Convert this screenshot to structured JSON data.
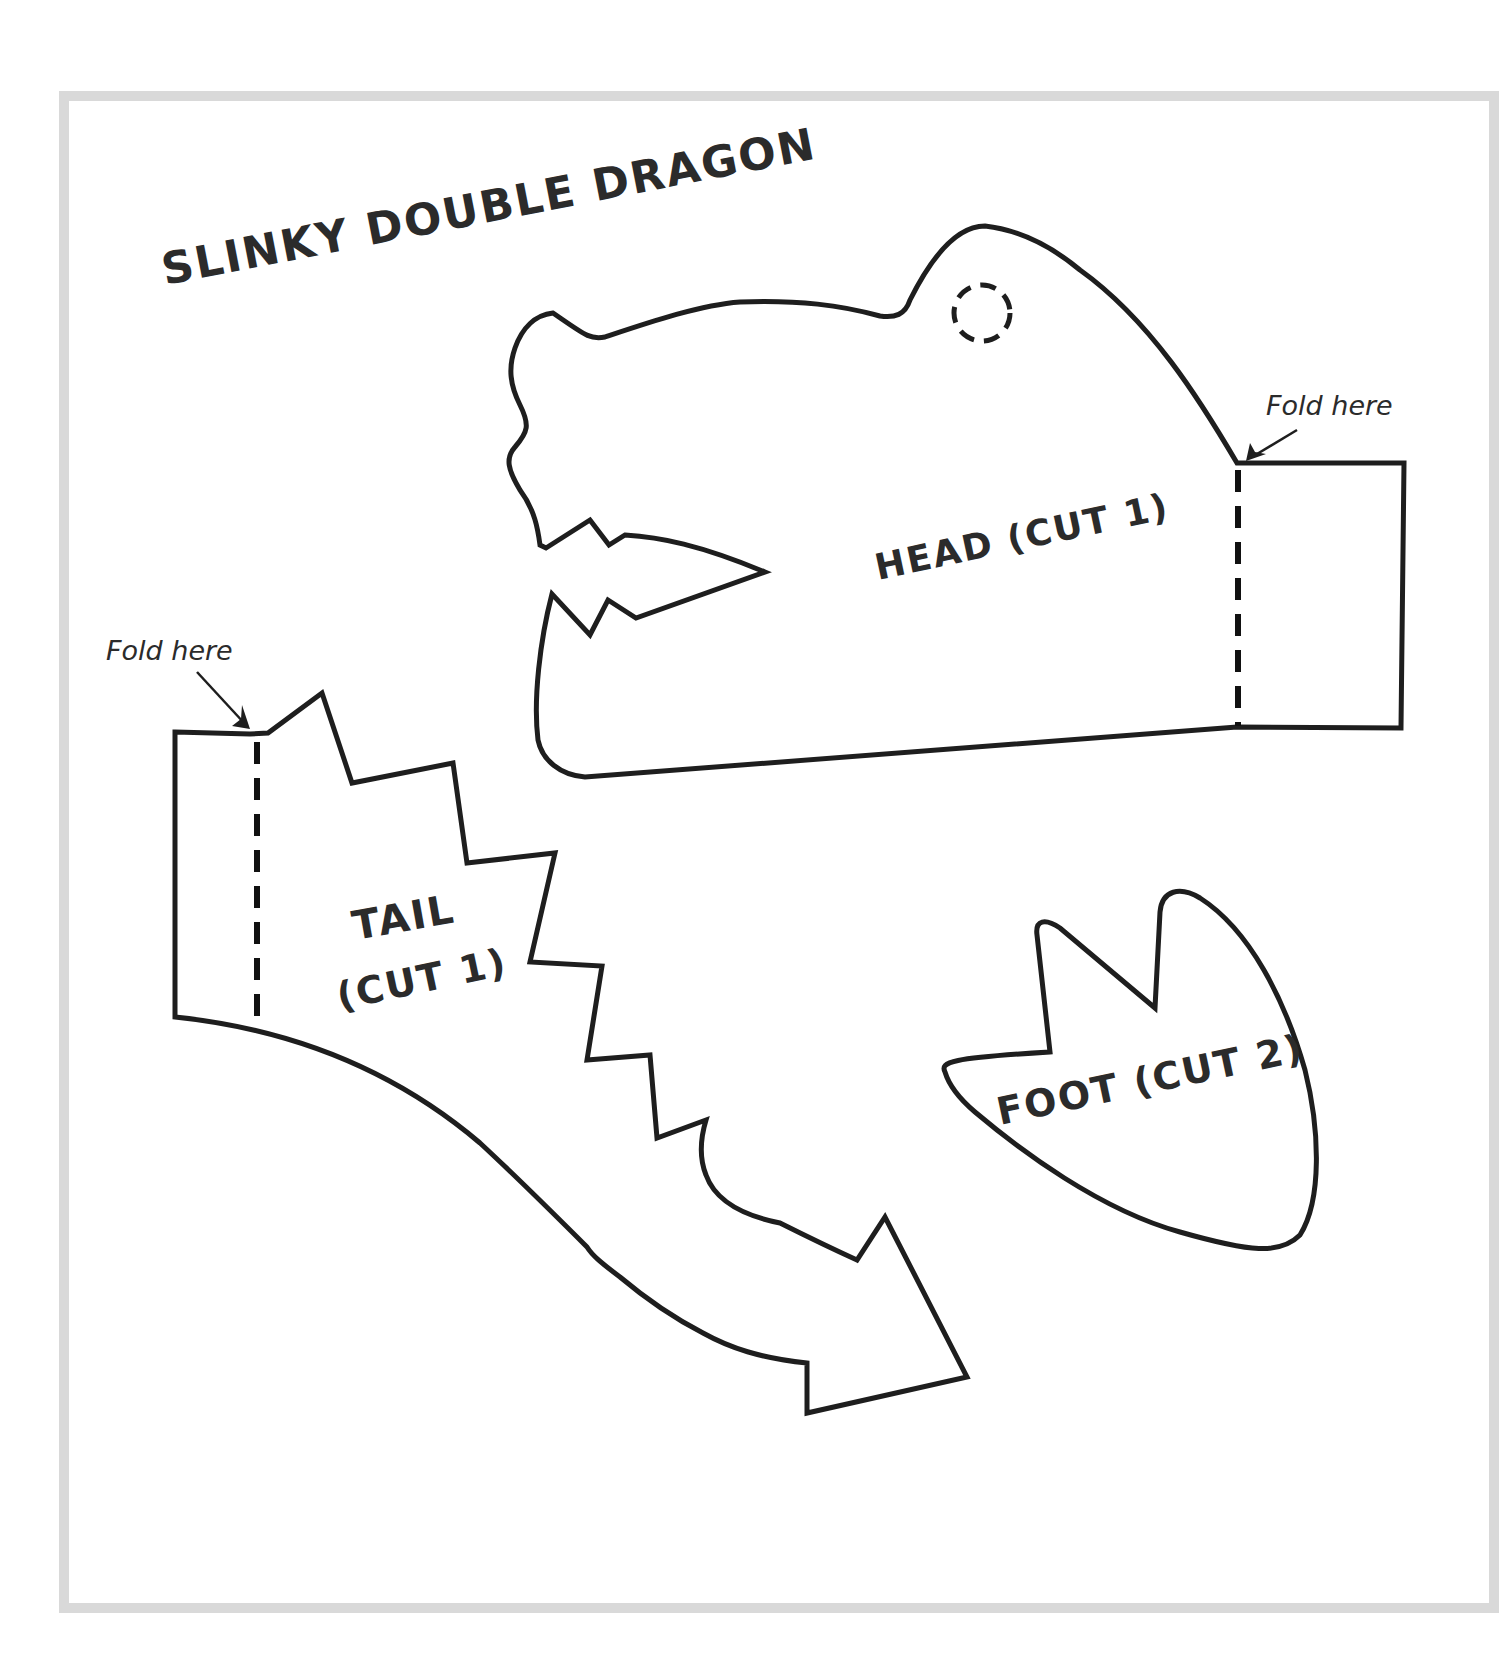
{
  "title": "SLINKY DOUBLE DRAGON",
  "pieces": {
    "head": {
      "label": "HEAD (CUT 1)",
      "fold_label": "Fold here"
    },
    "tail": {
      "label_line1": "TAIL",
      "label_line2": "(CUT 1)",
      "fold_label": "Fold here"
    },
    "foot": {
      "label": "FOOT (CUT 2)"
    }
  },
  "colors": {
    "border": "#d9d9d9",
    "line": "#1e1e1e",
    "text": "#2b2b2b",
    "background": "#ffffff"
  }
}
